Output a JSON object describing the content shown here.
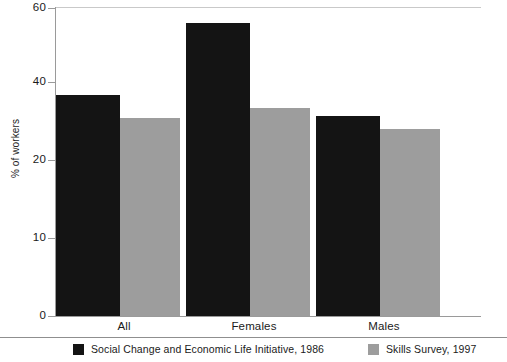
{
  "chart_data": {
    "type": "bar",
    "title": "",
    "xlabel": "",
    "ylabel": "% of workers",
    "ylim": [
      0,
      60
    ],
    "grid": false,
    "legend_position": "bottom",
    "categories": [
      "All",
      "Females",
      "Males"
    ],
    "y_ticks": [
      {
        "value": 0,
        "label": "0",
        "y_px": 316
      },
      {
        "value": 10,
        "label": "10",
        "y_px": 238
      },
      {
        "value": 20,
        "label": "20",
        "y_px": 160
      },
      {
        "value": 40,
        "label": "40",
        "y_px": 82
      },
      {
        "value": 60,
        "label": "60",
        "y_px": 8
      }
    ],
    "series": [
      {
        "name": "Social Change and Economic Life Initiative, 1986",
        "color": "#141414",
        "values": [
          43.0,
          57.0,
          39.0
        ]
      },
      {
        "name": "Skills Survey, 1997",
        "color": "#9d9d9d",
        "values": [
          38.5,
          40.5,
          36.5
        ]
      }
    ]
  },
  "axis": {
    "y_title": "% of workers"
  },
  "legend": {
    "entries": [
      {
        "label": "Social Change and Economic Life Initiative, 1986",
        "color": "#141414"
      },
      {
        "label": "Skills Survey, 1997",
        "color": "#9d9d9d"
      }
    ]
  },
  "colors": {
    "series_a": "#141414",
    "series_b": "#9d9d9d",
    "axis": "#9a9a9a",
    "text": "#1a1a1a",
    "background": "#ffffff"
  }
}
